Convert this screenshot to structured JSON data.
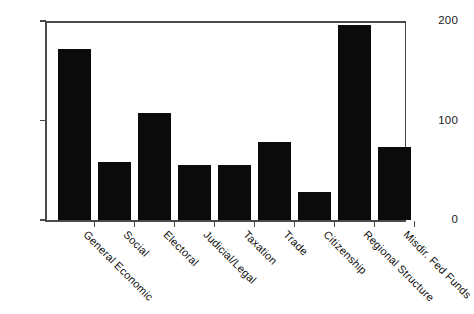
{
  "chart_data": {
    "type": "bar",
    "title": "",
    "subtitle": "",
    "xlabel": "",
    "ylabel": "",
    "ylim": [
      0,
      200
    ],
    "yticks": [
      0,
      100,
      200
    ],
    "grid": false,
    "legend": false,
    "bar_color": "#0b0b0b",
    "axis_color": "#4a4a4a",
    "categories": [
      "General Economic",
      "Social",
      "Electoral",
      "Judicial/Legal",
      "Taxation",
      "Trade",
      "Citizenship",
      "Regional Structure",
      "Misdir. Fed Funds"
    ],
    "values": [
      172,
      58,
      108,
      55,
      55,
      78,
      28,
      196,
      73
    ]
  }
}
